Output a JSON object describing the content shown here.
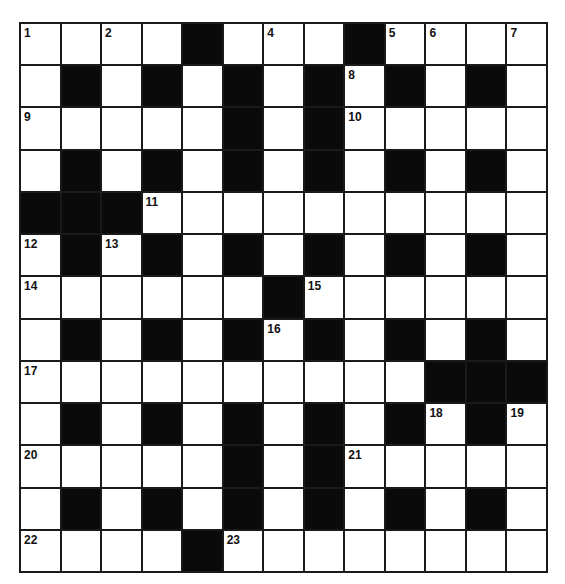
{
  "puzzle": {
    "rows": 13,
    "cols": 13,
    "colors": {
      "block": "#0a0a0a",
      "cell": "#ffffff",
      "grid_line": "#1a1a1a",
      "number": "#111111"
    },
    "layout": [
      "....#...#....",
      ".#.#.#.#.#.#.",
      ".....#.#.....",
      ".#.#.#.#.#.#.",
      "###..........",
      ".#.#.#.#.#.#.",
      "......#......",
      ".#.#.#.#.#.#.",
      "..........###",
      ".#.#.#.#.#.#.",
      ".....#.#.....",
      ".#.#.#.#.#.#.",
      "....#........"
    ],
    "numbers": [
      {
        "row": 0,
        "col": 0,
        "n": "1"
      },
      {
        "row": 0,
        "col": 2,
        "n": "2"
      },
      {
        "row": 0,
        "col": 4,
        "n": "3"
      },
      {
        "row": 0,
        "col": 6,
        "n": "4"
      },
      {
        "row": 0,
        "col": 9,
        "n": "5"
      },
      {
        "row": 0,
        "col": 10,
        "n": "6"
      },
      {
        "row": 0,
        "col": 12,
        "n": "7"
      },
      {
        "row": 1,
        "col": 8,
        "n": "8"
      },
      {
        "row": 2,
        "col": 0,
        "n": "9"
      },
      {
        "row": 2,
        "col": 8,
        "n": "10"
      },
      {
        "row": 4,
        "col": 3,
        "n": "11"
      },
      {
        "row": 5,
        "col": 0,
        "n": "12"
      },
      {
        "row": 5,
        "col": 2,
        "n": "13"
      },
      {
        "row": 6,
        "col": 0,
        "n": "14"
      },
      {
        "row": 6,
        "col": 7,
        "n": "15"
      },
      {
        "row": 7,
        "col": 6,
        "n": "16"
      },
      {
        "row": 8,
        "col": 0,
        "n": "17"
      },
      {
        "row": 9,
        "col": 10,
        "n": "18"
      },
      {
        "row": 9,
        "col": 12,
        "n": "19"
      },
      {
        "row": 10,
        "col": 0,
        "n": "20"
      },
      {
        "row": 10,
        "col": 8,
        "n": "21"
      },
      {
        "row": 12,
        "col": 0,
        "n": "22"
      },
      {
        "row": 12,
        "col": 5,
        "n": "23"
      }
    ]
  }
}
